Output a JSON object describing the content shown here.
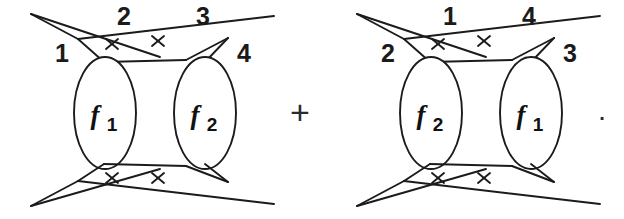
{
  "figure": {
    "kind": "feynman-diagram-sum",
    "ink_color": "#1b1b1b",
    "background_color": "#ffffff"
  },
  "operators": {
    "plus": "+",
    "period": "."
  },
  "diagrams": [
    {
      "id": "left-diagram",
      "blobs": [
        {
          "id": "blob-f1-left",
          "f": "f",
          "sub": "1"
        },
        {
          "id": "blob-f2-left",
          "f": "f",
          "sub": "2"
        }
      ],
      "leg_labels": {
        "top_left": "2",
        "top_right": "3",
        "outer_left": "1",
        "outer_right": "4"
      },
      "cross_marks": 4
    },
    {
      "id": "right-diagram",
      "blobs": [
        {
          "id": "blob-f2-right",
          "f": "f",
          "sub": "2"
        },
        {
          "id": "blob-f1-right",
          "f": "f",
          "sub": "1"
        }
      ],
      "leg_labels": {
        "top_left": "1",
        "top_right": "4",
        "outer_left": "2",
        "outer_right": "3"
      },
      "cross_marks": 4
    }
  ]
}
